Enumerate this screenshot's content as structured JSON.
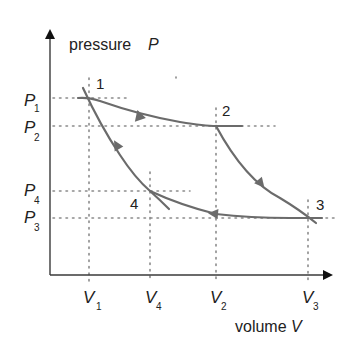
{
  "diagram": {
    "type": "pV-cycle",
    "y_axis": {
      "label": "pressure",
      "symbol": "P"
    },
    "x_axis": {
      "label": "volume",
      "symbol": "V"
    },
    "points": [
      {
        "id": "1",
        "label": "1",
        "v": "V1",
        "p": "P1"
      },
      {
        "id": "2",
        "label": "2",
        "v": "V2",
        "p": "P2"
      },
      {
        "id": "3",
        "label": "3",
        "v": "V3",
        "p": "P3"
      },
      {
        "id": "4",
        "label": "4",
        "v": "V4",
        "p": "P4"
      }
    ],
    "p_ticks": [
      {
        "main": "P",
        "sub": "1"
      },
      {
        "main": "P",
        "sub": "2"
      },
      {
        "main": "P",
        "sub": "4"
      },
      {
        "main": "P",
        "sub": "3"
      }
    ],
    "v_ticks": [
      {
        "main": "V",
        "sub": "1"
      },
      {
        "main": "V",
        "sub": "4"
      },
      {
        "main": "V",
        "sub": "2"
      },
      {
        "main": "V",
        "sub": "3"
      }
    ],
    "processes": [
      {
        "from": "1",
        "to": "2",
        "direction": "forward"
      },
      {
        "from": "2",
        "to": "3",
        "direction": "forward"
      },
      {
        "from": "3",
        "to": "4",
        "direction": "forward"
      },
      {
        "from": "4",
        "to": "1",
        "direction": "forward"
      }
    ],
    "colors": {
      "curve": "#6b6b6b",
      "axis": "#3a3a3a",
      "guide": "#8a8a8a",
      "text": "#222222"
    }
  }
}
